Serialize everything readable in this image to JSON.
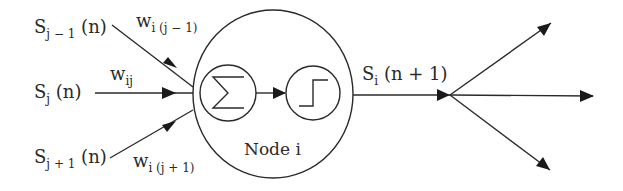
{
  "diagram": {
    "type": "neural-network-node",
    "inputs": [
      {
        "signal_main": "S",
        "signal_sub": "j − 1",
        "signal_arg": " (n)",
        "weight_main": "w",
        "weight_sub": "i (j − 1)"
      },
      {
        "signal_main": "S",
        "signal_sub": "j",
        "signal_arg": " (n)",
        "weight_main": "w",
        "weight_sub": "ij"
      },
      {
        "signal_main": "S",
        "signal_sub": "j + 1",
        "signal_arg": " (n)",
        "weight_main": "w",
        "weight_sub": "i (j + 1)"
      }
    ],
    "node": {
      "label": "Node i",
      "summation_icon": "∑",
      "activation_icon": "step-function"
    },
    "output": {
      "signal_main": "S",
      "signal_sub": "i",
      "signal_arg": " (n + 1)",
      "branches": 3
    },
    "colors": {
      "stroke": "#2a2a2a",
      "background": "#ffffff"
    }
  }
}
